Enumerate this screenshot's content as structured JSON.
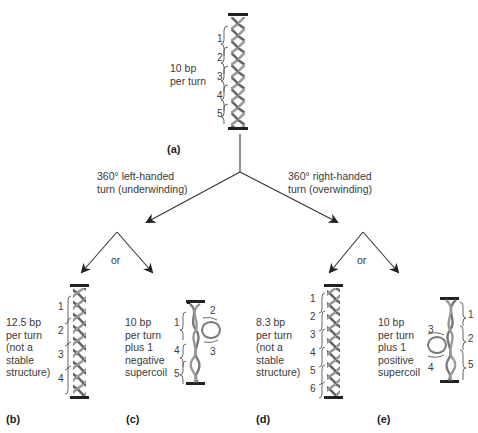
{
  "panels": {
    "a": {
      "label": "(a)",
      "description": "10 bp\nper turn",
      "turns": [
        "1",
        "2",
        "3",
        "4",
        "5"
      ]
    },
    "b": {
      "label": "(b)",
      "description": "12.5 bp\nper turn\n(not a\nstable\nstructure)",
      "turns": [
        "1",
        "2",
        "3",
        "4"
      ]
    },
    "c": {
      "label": "(c)",
      "description": "10 bp\nper turn\nplus 1\nnegative\nsupercoil",
      "turns": [
        "1",
        "2",
        "3",
        "4",
        "5"
      ]
    },
    "d": {
      "label": "(d)",
      "description": "8.3 bp\nper turn\n(not a\nstable\nstructure)",
      "turns": [
        "1",
        "2",
        "3",
        "4",
        "5",
        "6"
      ]
    },
    "e": {
      "label": "(e)",
      "description": "10 bp\nper turn\nplus 1\npositive\nsupercoil",
      "turns": [
        "1",
        "2",
        "3",
        "4",
        "5"
      ]
    }
  },
  "branches": {
    "left": "360° left-handed\nturn (underwinding)",
    "right": "360° right-handed\nturn (overwinding)",
    "or_left": "or",
    "or_right": "or"
  },
  "colors": {
    "line": "#333333",
    "helix": "#777777",
    "bar": "#222222"
  }
}
